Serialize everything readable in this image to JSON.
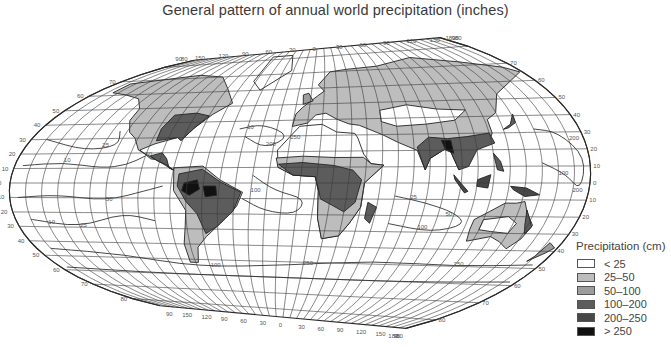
{
  "title": "General pattern of annual world precipitation (inches)",
  "legend": {
    "title": "Precipitation (cm)",
    "items": [
      {
        "label": "< 25",
        "color": "#ffffff"
      },
      {
        "label": "25–50",
        "color": "#bdbdbd"
      },
      {
        "label": "50–100",
        "color": "#9d9d9d"
      },
      {
        "label": "100–200",
        "color": "#5c5c5c"
      },
      {
        "label": "200–250",
        "color": "#474747"
      },
      {
        "label": "> 250",
        "color": "#111111"
      }
    ]
  },
  "map": {
    "projection_labels": {
      "top_longitudes": [
        "90",
        "80",
        "150",
        "120",
        "90",
        "60",
        "30",
        "0",
        "30",
        "60",
        "90",
        "120",
        "150",
        "180",
        "90",
        "80"
      ],
      "bottom_longitudes": [
        "90",
        "150",
        "120",
        "90",
        "60",
        "30",
        "0",
        "30",
        "60",
        "90",
        "120",
        "150",
        "180",
        "90",
        "80"
      ],
      "left_latitudes": [
        "70",
        "60",
        "50",
        "40",
        "30",
        "20",
        "10",
        "0",
        "10",
        "20",
        "30",
        "40",
        "50",
        "60",
        "70",
        "80"
      ],
      "right_latitudes": [
        "70",
        "60",
        "50",
        "40",
        "30",
        "20",
        "10",
        "0",
        "10",
        "20",
        "30",
        "40",
        "50",
        "60",
        "70",
        "80"
      ]
    },
    "isohyet_labels": [
      "10",
      "25",
      "50",
      "100",
      "200",
      "250",
      "10",
      "25",
      "50",
      "100",
      "200",
      "250",
      "100",
      "250",
      "200",
      "25",
      "50",
      "100",
      "10"
    ],
    "grid_color": "#3a3a3a",
    "outline_color": "#2a2a2a"
  }
}
